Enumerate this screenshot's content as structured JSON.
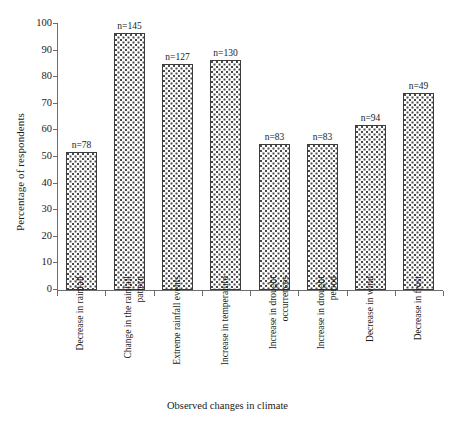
{
  "chart_data": {
    "type": "bar",
    "title": "",
    "xlabel": "Observed changes in climate",
    "ylabel": "Percentage of respondents",
    "ylim": [
      0,
      100
    ],
    "ytick_step": 10,
    "grid": false,
    "legend": null,
    "categories": [
      "Decrease in rainfall",
      "Change in the rainfall pattern",
      "Extreme rainfall events",
      "Increase in temperature",
      "Increase in drought occurrences",
      "Increase in drought period",
      "Decrease in wind",
      "Decrease in frost"
    ],
    "values": [
      52,
      96.5,
      85,
      86.5,
      55,
      55,
      62,
      74
    ],
    "annotations": [
      "n=78",
      "n=145",
      "n=127",
      "n=130",
      "n=83",
      "n=83",
      "n=94",
      "n=49"
    ],
    "yticks": [
      "0",
      "10",
      "20",
      "30",
      "40",
      "50",
      "60",
      "70",
      "80",
      "90",
      "100"
    ],
    "ytick_values": [
      0,
      10,
      20,
      30,
      40,
      50,
      60,
      70,
      80,
      90,
      100
    ]
  }
}
